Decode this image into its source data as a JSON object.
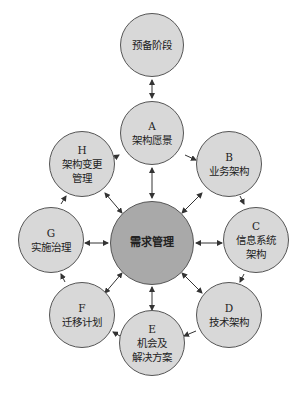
{
  "diagram": {
    "preliminary": {
      "lines": [
        "预备阶段"
      ]
    },
    "center": {
      "lines": [
        "需求管理"
      ]
    },
    "phases": [
      {
        "id": "A",
        "lines": [
          "A",
          "架构愿景"
        ]
      },
      {
        "id": "B",
        "lines": [
          "B",
          "业务架构"
        ]
      },
      {
        "id": "C",
        "lines": [
          "C",
          "信息系统",
          "架构"
        ]
      },
      {
        "id": "D",
        "lines": [
          "D",
          "技术架构"
        ]
      },
      {
        "id": "E",
        "lines": [
          "E",
          "机会及",
          "解决方案"
        ]
      },
      {
        "id": "F",
        "lines": [
          "F",
          "迁移计划"
        ]
      },
      {
        "id": "G",
        "lines": [
          "G",
          "实施治理"
        ]
      },
      {
        "id": "H",
        "lines": [
          "H",
          "架构变更",
          "管理"
        ]
      }
    ],
    "colors": {
      "phase_fill": "#d8d8d8",
      "center_fill": "#a9a9a9",
      "stroke": "#555555"
    }
  }
}
